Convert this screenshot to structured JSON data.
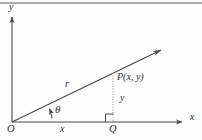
{
  "figure": {
    "background_color": "#fdfdfd",
    "stroke_color": "#4a4a4a",
    "text_color": "#2e2e2e",
    "top_rule_color": "#8e8e8e"
  },
  "labels": {
    "y_axis": "y",
    "x_axis": "x",
    "origin": "O",
    "radius": "r",
    "angle": "θ",
    "point": "P(x, y)",
    "leg_horizontal": "x",
    "leg_vertical": "y",
    "foot": "Q"
  },
  "geometry": {
    "origin": [
      12,
      122
    ],
    "y_axis_tip": [
      12,
      13
    ],
    "x_axis_tip": [
      188,
      122
    ],
    "ray_tip": [
      167,
      47
    ],
    "point_p": [
      113,
      73
    ],
    "foot_q": [
      113,
      122
    ],
    "angle_degrees": 23,
    "right_angle_marker": [
      106,
      114,
      8,
      8
    ],
    "dotted_segment": [
      113,
      73,
      113,
      122
    ]
  }
}
